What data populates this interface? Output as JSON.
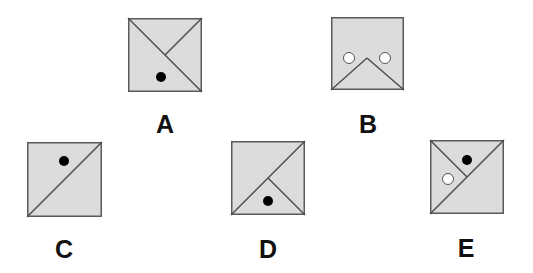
{
  "colors": {
    "box_fill": "#dcdcdc",
    "box_stroke": "#5a5a5a",
    "line": "#4a4a4a",
    "dot_black": "#000000",
    "dot_white": "#ffffff",
    "dot_white_stroke": "#555555",
    "label": "#111111"
  },
  "figures": [
    {
      "id": "A",
      "label": "A",
      "x": 128,
      "y": 18,
      "size": 74,
      "label_x": 145,
      "label_y": 112,
      "lines": [
        {
          "x1": 0,
          "y1": 0,
          "x2": 74,
          "y2": 74
        },
        {
          "x1": 74,
          "y1": 0,
          "x2": 37,
          "y2": 37
        }
      ],
      "dots": [
        {
          "cx": 33,
          "cy": 59,
          "r": 5,
          "fill": "black"
        }
      ]
    },
    {
      "id": "B",
      "label": "B",
      "x": 331,
      "y": 17,
      "size": 73,
      "label_x": 348,
      "label_y": 112,
      "lines": [
        {
          "x1": 0,
          "y1": 73,
          "x2": 36,
          "y2": 41
        },
        {
          "x1": 36,
          "y1": 41,
          "x2": 73,
          "y2": 73
        }
      ],
      "dots": [
        {
          "cx": 18,
          "cy": 41,
          "r": 5.5,
          "fill": "white"
        },
        {
          "cx": 54,
          "cy": 41,
          "r": 5.5,
          "fill": "white"
        }
      ]
    },
    {
      "id": "C",
      "label": "C",
      "x": 27,
      "y": 142,
      "size": 75,
      "label_x": 44,
      "label_y": 237,
      "lines": [
        {
          "x1": 0,
          "y1": 75,
          "x2": 75,
          "y2": 0
        }
      ],
      "dots": [
        {
          "cx": 37,
          "cy": 19,
          "r": 5,
          "fill": "black"
        }
      ]
    },
    {
      "id": "D",
      "label": "D",
      "x": 231,
      "y": 141,
      "size": 74,
      "label_x": 248,
      "label_y": 237,
      "lines": [
        {
          "x1": 0,
          "y1": 74,
          "x2": 74,
          "y2": 0
        },
        {
          "x1": 37,
          "y1": 37,
          "x2": 74,
          "y2": 74
        }
      ],
      "dots": [
        {
          "cx": 37,
          "cy": 60,
          "r": 5,
          "fill": "black"
        }
      ]
    },
    {
      "id": "E",
      "label": "E",
      "x": 430,
      "y": 140,
      "size": 74,
      "label_x": 446,
      "label_y": 236,
      "lines": [
        {
          "x1": 0,
          "y1": 74,
          "x2": 74,
          "y2": 0
        },
        {
          "x1": 0,
          "y1": 0,
          "x2": 37,
          "y2": 37
        }
      ],
      "dots": [
        {
          "cx": 37,
          "cy": 20,
          "r": 5,
          "fill": "black"
        },
        {
          "cx": 18,
          "cy": 39,
          "r": 5.5,
          "fill": "white"
        }
      ]
    }
  ]
}
